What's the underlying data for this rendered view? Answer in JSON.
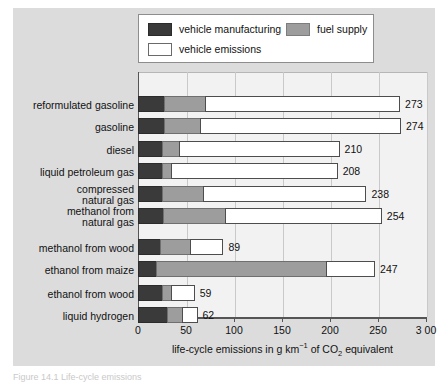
{
  "legend": {
    "items": [
      {
        "key": "manufacturing",
        "label": "vehicle manufacturing",
        "color": "#3a3a3a"
      },
      {
        "key": "fuel",
        "label": "fuel supply",
        "color": "#9d9d9d"
      },
      {
        "key": "emissions",
        "label": "vehicle emissions",
        "color": "#ffffff"
      }
    ]
  },
  "axis": {
    "ticks": [
      "0",
      "50",
      "100",
      "150",
      "200",
      "250",
      "3 00"
    ],
    "tick_values": [
      0,
      50,
      100,
      150,
      200,
      250,
      300
    ],
    "title_prefix": "life-cycle emissions in g km",
    "title_sup": "−1",
    "title_mid": " of CO",
    "title_sub": "2",
    "title_suffix": " equivalent"
  },
  "caption": {
    "text": "Figure 14.1 Life-cycle emissions"
  },
  "chart_data": {
    "type": "bar",
    "orientation": "horizontal",
    "stacked": true,
    "title": "",
    "xlabel": "life-cycle emissions in g km⁻¹ of CO₂ equivalent",
    "ylabel": "",
    "xlim": [
      0,
      300
    ],
    "xticks": [
      0,
      50,
      100,
      150,
      200,
      250,
      300
    ],
    "grid": "vertical",
    "legend_position": "top",
    "series": [
      {
        "name": "vehicle manufacturing",
        "color": "#3a3a3a",
        "values": [
          27,
          27,
          25,
          25,
          25,
          26,
          23,
          19,
          25,
          30
        ]
      },
      {
        "name": "fuel supply",
        "color": "#9d9d9d",
        "values": [
          43,
          38,
          18,
          9,
          43,
          65,
          31,
          177,
          9,
          16
        ]
      },
      {
        "name": "vehicle emissions",
        "color": "#ffffff",
        "values": [
          203,
          209,
          167,
          174,
          170,
          163,
          35,
          51,
          25,
          16
        ]
      }
    ],
    "categories": [
      "reformulated gasoline",
      "gasoline",
      "diesel",
      "liquid petroleum gas",
      "compressed natural gas",
      "methanol from natural gas",
      "methanol from wood",
      "ethanol from maize",
      "ethanol from wood",
      "liquid hydrogen"
    ],
    "totals": [
      273,
      274,
      210,
      208,
      238,
      254,
      89,
      247,
      59,
      62
    ]
  },
  "rows": [
    {
      "label_lines": [
        "reformulated gasoline"
      ],
      "total": "273"
    },
    {
      "label_lines": [
        "gasoline"
      ],
      "total": "274"
    },
    {
      "label_lines": [
        "diesel"
      ],
      "total": "210"
    },
    {
      "label_lines": [
        "liquid petroleum gas"
      ],
      "total": "208"
    },
    {
      "label_lines": [
        "compressed",
        "natural gas"
      ],
      "total": "238"
    },
    {
      "label_lines": [
        "methanol from",
        "natural gas"
      ],
      "total": "254"
    },
    {
      "label_lines": [
        "methanol from wood"
      ],
      "total": "89"
    },
    {
      "label_lines": [
        "ethanol from maize"
      ],
      "total": "247"
    },
    {
      "label_lines": [
        "ethanol from wood"
      ],
      "total": "59"
    },
    {
      "label_lines": [
        "liquid hydrogen"
      ],
      "total": "62"
    }
  ]
}
